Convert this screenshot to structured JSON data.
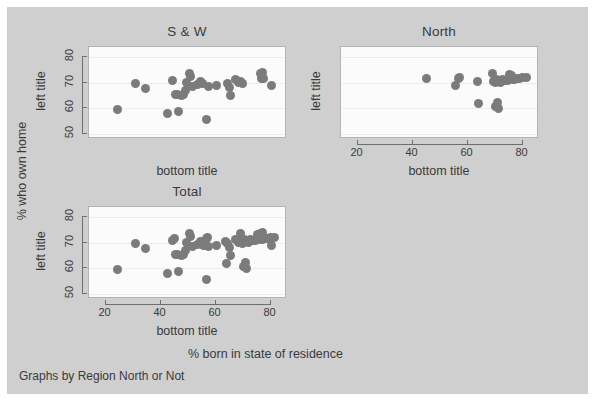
{
  "figure": {
    "background_color": "#cfcfcf",
    "panel_background_color": "#fbfbfb",
    "marker_color": "#7b7b7b",
    "overall_ylabel": "% who own home",
    "overall_xlabel": "% born in state of residence",
    "note": "Graphs by Region North or Not"
  },
  "chart_data": {
    "type": "scatter",
    "title": "",
    "xlabel": "% born in state of residence",
    "ylabel": "% who own home",
    "note": "Graphs by Region North or Not",
    "xlim": [
      14,
      86
    ],
    "ylim": [
      48,
      84
    ],
    "xticks": [
      20,
      40,
      60,
      80
    ],
    "yticks": [
      50,
      60,
      70,
      80
    ],
    "grid": true,
    "legend": "none",
    "panel_axis_titles": {
      "left": "left title",
      "bottom": "bottom title"
    },
    "panels": [
      {
        "name": "S & W",
        "title": "S & W",
        "left_title": "left title",
        "bottom_title": "bottom title",
        "show_y_tick_labels": true,
        "show_x_tick_labels": false,
        "points": [
          [
            24.3,
            59.4
          ],
          [
            30.9,
            69.6
          ],
          [
            34.6,
            67.6
          ],
          [
            42.5,
            57.9
          ],
          [
            44.4,
            70.7
          ],
          [
            45.3,
            65.6
          ],
          [
            46.1,
            65.3
          ],
          [
            46.6,
            58.8
          ],
          [
            47.6,
            65.2
          ],
          [
            48.5,
            65.3
          ],
          [
            49.1,
            67.1
          ],
          [
            49.6,
            70.1
          ],
          [
            50.4,
            73.5
          ],
          [
            50.8,
            72.6
          ],
          [
            51.5,
            68.5
          ],
          [
            53.4,
            69.5
          ],
          [
            54.6,
            70.6
          ],
          [
            55.3,
            69.7
          ],
          [
            56.9,
            55.8
          ],
          [
            57.3,
            68.6
          ],
          [
            60.2,
            68.9
          ],
          [
            64.4,
            69.6
          ],
          [
            65.0,
            68.0
          ],
          [
            65.4,
            65.0
          ],
          [
            67.1,
            71.2
          ],
          [
            68.3,
            70.3
          ],
          [
            69.0,
            70.4
          ],
          [
            69.9,
            69.6
          ],
          [
            76.2,
            73.5
          ],
          [
            76.8,
            71.8
          ],
          [
            77.6,
            71.5
          ],
          [
            77.1,
            74.2
          ],
          [
            80.4,
            68.8
          ]
        ]
      },
      {
        "name": "North",
        "title": "North",
        "left_title": "left title",
        "bottom_title": "bottom title",
        "show_y_tick_labels": false,
        "show_x_tick_labels": true,
        "points": [
          [
            45.1,
            71.8
          ],
          [
            55.8,
            68.8
          ],
          [
            56.6,
            71.6
          ],
          [
            57.2,
            71.9
          ],
          [
            63.6,
            70.6
          ],
          [
            64.0,
            61.8
          ],
          [
            69.2,
            73.5
          ],
          [
            69.6,
            70.4
          ],
          [
            70.2,
            70.2
          ],
          [
            70.6,
            71.1
          ],
          [
            70.3,
            60.7
          ],
          [
            70.8,
            62.4
          ],
          [
            71.1,
            60.1
          ],
          [
            71.4,
            70.6
          ],
          [
            72.0,
            70.1
          ],
          [
            72.6,
            71.3
          ],
          [
            73.4,
            70.8
          ],
          [
            74.6,
            71.0
          ],
          [
            75.3,
            73.4
          ],
          [
            75.9,
            72.7
          ],
          [
            76.4,
            71.3
          ],
          [
            77.2,
            71.4
          ],
          [
            78.1,
            71.6
          ],
          [
            79.0,
            71.8
          ],
          [
            80.1,
            72.0
          ],
          [
            81.4,
            72.2
          ]
        ]
      },
      {
        "name": "Total",
        "title": "Total",
        "left_title": "left title",
        "bottom_title": "bottom title",
        "show_y_tick_labels": true,
        "show_x_tick_labels": true,
        "points": [
          [
            24.3,
            59.4
          ],
          [
            30.9,
            69.6
          ],
          [
            34.6,
            67.6
          ],
          [
            42.5,
            57.9
          ],
          [
            44.4,
            70.7
          ],
          [
            45.3,
            65.6
          ],
          [
            46.1,
            65.3
          ],
          [
            46.6,
            58.8
          ],
          [
            47.6,
            65.2
          ],
          [
            48.5,
            65.3
          ],
          [
            49.1,
            67.1
          ],
          [
            49.6,
            70.1
          ],
          [
            50.4,
            73.5
          ],
          [
            50.8,
            72.6
          ],
          [
            51.5,
            68.5
          ],
          [
            53.4,
            69.5
          ],
          [
            54.6,
            70.6
          ],
          [
            55.3,
            69.7
          ],
          [
            56.9,
            55.8
          ],
          [
            57.3,
            68.6
          ],
          [
            60.2,
            68.9
          ],
          [
            64.4,
            69.6
          ],
          [
            65.0,
            68.0
          ],
          [
            65.4,
            65.0
          ],
          [
            67.1,
            71.2
          ],
          [
            68.3,
            70.3
          ],
          [
            69.0,
            70.4
          ],
          [
            69.9,
            69.6
          ],
          [
            76.2,
            73.5
          ],
          [
            76.8,
            71.8
          ],
          [
            77.6,
            71.5
          ],
          [
            77.1,
            74.2
          ],
          [
            80.4,
            68.8
          ],
          [
            45.1,
            71.8
          ],
          [
            55.8,
            68.8
          ],
          [
            56.6,
            71.6
          ],
          [
            57.2,
            71.9
          ],
          [
            63.6,
            70.6
          ],
          [
            64.0,
            61.8
          ],
          [
            69.2,
            73.5
          ],
          [
            69.6,
            70.4
          ],
          [
            70.2,
            70.2
          ],
          [
            70.6,
            71.1
          ],
          [
            70.3,
            60.7
          ],
          [
            70.8,
            62.4
          ],
          [
            71.1,
            60.1
          ],
          [
            71.4,
            70.6
          ],
          [
            72.0,
            70.1
          ],
          [
            72.6,
            71.3
          ],
          [
            73.4,
            70.8
          ],
          [
            74.6,
            71.0
          ],
          [
            75.3,
            73.4
          ],
          [
            75.9,
            72.7
          ],
          [
            76.4,
            71.3
          ],
          [
            77.2,
            71.4
          ],
          [
            78.1,
            71.6
          ],
          [
            79.0,
            71.8
          ],
          [
            80.1,
            72.0
          ],
          [
            81.4,
            72.2
          ]
        ]
      }
    ]
  }
}
